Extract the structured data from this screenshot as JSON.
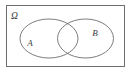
{
  "figure": {
    "type": "venn-diagram",
    "background_color": "#ffffff",
    "stroke_color": "#6e6e6e",
    "label_color": "#3a3a3a"
  },
  "universe": {
    "label": "Ω",
    "name": "omega",
    "frame": {
      "x": 6,
      "y": 5,
      "width": 119,
      "height": 62,
      "stroke_width": 1
    },
    "label_position": {
      "x": 11,
      "y": 18
    }
  },
  "sets": [
    {
      "id": "A",
      "label": "A",
      "name": "set-a",
      "ellipse": {
        "cx": 49,
        "cy": 38.5,
        "rx": 29,
        "ry": 19.5
      },
      "label_position": {
        "x": 30,
        "y": 45
      }
    },
    {
      "id": "B",
      "label": "B",
      "name": "set-b",
      "ellipse": {
        "cx": 85.5,
        "cy": 38.5,
        "rx": 28,
        "ry": 19.5
      },
      "label_position": {
        "x": 94,
        "y": 35
      }
    }
  ],
  "intersection": {
    "name": "a-intersect-b",
    "label": "",
    "x_range": [
      57.5,
      78.0
    ]
  }
}
